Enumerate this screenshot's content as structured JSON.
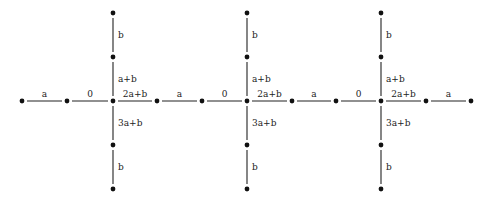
{
  "diagram": {
    "type": "graph",
    "nodes": {
      "horizontal_y": 101,
      "horizontal_x": [
        22,
        67,
        113,
        157,
        202,
        247,
        292,
        336,
        381,
        426,
        471
      ],
      "vertical_x": [
        113,
        247,
        381
      ],
      "vertical_y": [
        13,
        57,
        101,
        145,
        189
      ]
    },
    "horizontal_edges": [
      {
        "from": 0,
        "to": 1,
        "label": "a"
      },
      {
        "from": 1,
        "to": 2,
        "label": "0"
      },
      {
        "from": 2,
        "to": 3,
        "label": "2a+b"
      },
      {
        "from": 3,
        "to": 4,
        "label": "a"
      },
      {
        "from": 4,
        "to": 5,
        "label": "0"
      },
      {
        "from": 5,
        "to": 6,
        "label": "2a+b"
      },
      {
        "from": 6,
        "to": 7,
        "label": "a"
      },
      {
        "from": 7,
        "to": 8,
        "label": "0"
      },
      {
        "from": 8,
        "to": 9,
        "label": "2a+b"
      },
      {
        "from": 9,
        "to": 10,
        "label": "a"
      }
    ],
    "vertical_edges_per_column": [
      {
        "from": 0,
        "to": 1,
        "label": "b"
      },
      {
        "from": 1,
        "to": 2,
        "label": "a+b"
      },
      {
        "from": 2,
        "to": 3,
        "label": "3a+b"
      },
      {
        "from": 3,
        "to": 4,
        "label": "b"
      }
    ]
  }
}
